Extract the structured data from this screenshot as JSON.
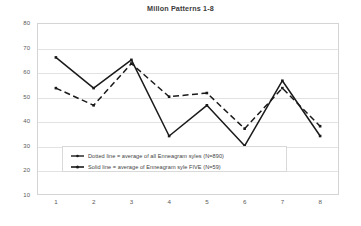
{
  "chart_data": {
    "type": "line",
    "title": "Millon Patterns 1-8",
    "xlabel": "",
    "ylabel": "",
    "categories": [
      "1",
      "2",
      "3",
      "4",
      "5",
      "6",
      "7",
      "8"
    ],
    "x": [
      1,
      2,
      3,
      4,
      5,
      6,
      7,
      8
    ],
    "ylim": [
      10,
      80
    ],
    "yticks": [
      10,
      20,
      30,
      40,
      50,
      60,
      70,
      80
    ],
    "grid": true,
    "legend_position": "inside-bottom-center",
    "series": [
      {
        "name": "Dotted line = average of all Enneagram syles (N=890)",
        "style": "dashed",
        "color": "#1a1a1a",
        "values": [
          53.5,
          46.5,
          63.5,
          50,
          51.5,
          37,
          53.5,
          38
        ]
      },
      {
        "name": "Solid line = average of Enneagram syle FIVE (N=59)",
        "style": "solid",
        "color": "#1a1a1a",
        "values": [
          66,
          53.5,
          65,
          34,
          46.5,
          30,
          56.5,
          34
        ]
      }
    ]
  },
  "legend": {
    "entries": [
      "Dotted line = average of all Enneagram  syles (N=890)",
      "Solid line = average of Enneagram  syle FIVE (N=59)"
    ]
  },
  "axes": {
    "y_ticks": [
      "80",
      "70",
      "60",
      "50",
      "40",
      "30",
      "20",
      "10"
    ],
    "x_ticks": [
      "1",
      "2",
      "3",
      "4",
      "5",
      "6",
      "7",
      "8"
    ]
  }
}
